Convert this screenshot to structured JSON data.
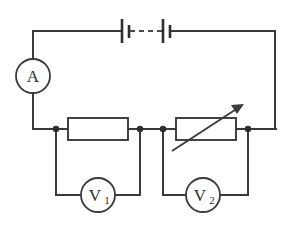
{
  "diagram": {
    "background_color": "#ffffff",
    "line_color": "#3a3a3a",
    "junction_color": "#2e2e2e"
  },
  "components": {
    "ammeter": {
      "name": "ammeter",
      "label": "A",
      "shape": "circle",
      "cx": 33,
      "cy": 76,
      "r": 17
    },
    "voltmeter_1": {
      "name": "voltmeter-1",
      "label": "V",
      "subscript": "1",
      "shape": "circle",
      "cx": 98,
      "cy": 195,
      "r": 17
    },
    "voltmeter_2": {
      "name": "voltmeter-2",
      "label": "V",
      "subscript": "2",
      "shape": "circle",
      "cx": 203,
      "cy": 195,
      "r": 17
    },
    "resistor": {
      "name": "fixed-resistor",
      "label": "",
      "shape": "rectangle",
      "x": 68,
      "y": 118,
      "width": 60,
      "height": 22
    },
    "rheostat": {
      "name": "variable-resistor",
      "label": "",
      "shape": "rectangle-with-arrow",
      "x": 176,
      "y": 118,
      "width": 60,
      "height": 22,
      "arrow_from_x": 172,
      "arrow_from_y": 151,
      "arrow_to_x": 243,
      "arrow_to_y": 105
    },
    "battery": {
      "name": "battery-cells",
      "label": "",
      "cell_count": 2,
      "long_plate_height": 24,
      "short_plate_height": 13,
      "cells": [
        {
          "long_x": 122,
          "short_x": 129
        },
        {
          "long_x": 163,
          "short_x": 170
        }
      ],
      "dash_from_x": 129,
      "dash_to_x": 163,
      "rail_y": 31
    }
  },
  "junctions": [
    {
      "name": "junction-left-node",
      "x": 56,
      "y": 129
    },
    {
      "name": "junction-resistor-right",
      "x": 140,
      "y": 129
    },
    {
      "name": "junction-mid-node",
      "x": 163,
      "y": 129
    },
    {
      "name": "junction-right-node",
      "x": 248,
      "y": 129
    }
  ],
  "wires": {
    "top_rail_left": "M33,31 L122,31",
    "top_rail_right": "M170,31 L275,31",
    "left_rail_top": "M33,31 L33,59",
    "left_rail_bottom": "M33,93 L33,129",
    "left_rail_to_resistor": "M33,129 L68,129",
    "right_rail": "M275,31 L275,129",
    "right_rail_to_node": "M248,129 L275,129",
    "resistor_to_mid": "M128,129 L176,129",
    "rheostat_to_right": "M236,129 L248,129",
    "v1_left_leg": "M56,129 L56,195 L81,195",
    "v1_right_leg": "M115,195 L140,195 L140,129",
    "v2_left_leg": "M163,129 L163,195 L186,195",
    "v2_right_leg": "M220,195 L248,195 L248,129"
  }
}
